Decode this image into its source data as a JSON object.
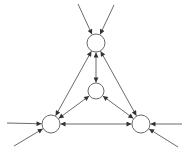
{
  "diagram": {
    "type": "directed-graph",
    "colors": {
      "stroke": "#6b6b6b",
      "node_fill": "#ffffff",
      "background": "#ffffff"
    },
    "nodes": [
      {
        "id": "top",
        "cx": 96,
        "cy": 43,
        "r": 9
      },
      {
        "id": "center",
        "cx": 96,
        "cy": 91,
        "r": 8
      },
      {
        "id": "bottom-left",
        "cx": 51,
        "cy": 124,
        "r": 9
      },
      {
        "id": "bottom-right",
        "cx": 141,
        "cy": 124,
        "r": 9
      }
    ],
    "edges": [
      {
        "from": "top",
        "to": "center",
        "bidirectional": true
      },
      {
        "from": "top",
        "to": "bottom-left",
        "bidirectional": true
      },
      {
        "from": "top",
        "to": "bottom-right",
        "bidirectional": true
      },
      {
        "from": "center",
        "to": "bottom-left",
        "bidirectional": true
      },
      {
        "from": "center",
        "to": "bottom-right",
        "bidirectional": true
      },
      {
        "from": "bottom-left",
        "to": "bottom-right",
        "bidirectional": true
      }
    ],
    "external_inputs": [
      {
        "to": "top",
        "from_point": [
          78,
          4
        ]
      },
      {
        "to": "top",
        "from_point": [
          114,
          5
        ]
      },
      {
        "to": "bottom-left",
        "from_point": [
          7,
          123
        ]
      },
      {
        "to": "bottom-left",
        "from_point": [
          14,
          146
        ]
      },
      {
        "to": "bottom-right",
        "from_point": [
          182,
          124
        ]
      },
      {
        "to": "bottom-right",
        "from_point": [
          178,
          147
        ]
      }
    ]
  }
}
